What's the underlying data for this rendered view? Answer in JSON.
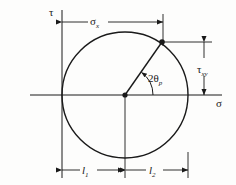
{
  "figure": {
    "type": "mohrs-circle-diagram",
    "background_color": "#fdfdfc",
    "line_color": "#1a1a1a"
  },
  "axes": {
    "vertical_label": "τ",
    "horizontal_label": "σ",
    "vertical_axis_x": 62,
    "horizontal_axis_y": 95
  },
  "circle": {
    "center_x": 125,
    "center_y": 95,
    "radius": 63
  },
  "radius_line": {
    "from_x": 125,
    "from_y": 95,
    "to_x": 162,
    "to_y": 42
  },
  "angle": {
    "label_main": "2θ",
    "label_sub": "p"
  },
  "dimensions": {
    "top": {
      "label_main": "σ",
      "label_sub": "x",
      "y": 22,
      "x_start": 62,
      "x_end": 163
    },
    "right": {
      "label_main": "τ",
      "label_sub": "xy",
      "x": 204,
      "y_start": 42,
      "y_end": 95
    },
    "bottom_left": {
      "label_main": "l",
      "label_sub": "1",
      "y": 170,
      "x_start": 62,
      "x_end": 124
    },
    "bottom_right": {
      "label_main": "l",
      "label_sub": "2",
      "y": 170,
      "x_start": 126,
      "x_end": 188
    }
  }
}
